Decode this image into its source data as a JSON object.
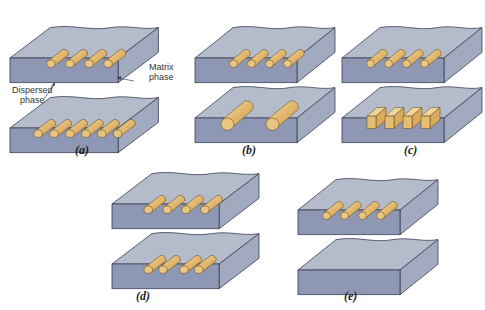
{
  "figure": {
    "labels": {
      "matrix_phase_line1": "Matrix",
      "matrix_phase_line2": "phase",
      "dispersed_phase_line1": "Dispersed",
      "dispersed_phase_line2": "phase"
    },
    "panels": [
      {
        "id": "a",
        "caption": "(a)",
        "meaning": "concentration",
        "top": "4 cylinders",
        "bottom": "6 cylinders"
      },
      {
        "id": "b",
        "caption": "(b)",
        "meaning": "size",
        "top": "4 small cylinders",
        "bottom": "2 large cylinders"
      },
      {
        "id": "c",
        "caption": "(c)",
        "meaning": "shape",
        "top": "4 cylinders",
        "bottom": "4 rectangular prisms"
      },
      {
        "id": "d",
        "caption": "(d)",
        "meaning": "distribution",
        "top": "4 evenly spaced cylinders",
        "bottom": "4 unevenly spaced cylinders"
      },
      {
        "id": "e",
        "caption": "(e)",
        "meaning": "orientation",
        "top": "4 horizontal cylinders",
        "bottom": "4 vertical cylinders"
      }
    ],
    "colors": {
      "block_top": "#b4bccc",
      "block_front": "#8e97b3",
      "block_side": "#a2aac0",
      "particle": "#e6c07a",
      "particle_dark": "#c99a4c",
      "outline": "#3a3f55"
    }
  }
}
